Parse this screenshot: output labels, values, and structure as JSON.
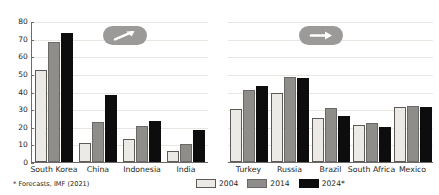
{
  "chart_data": {
    "type": "bar",
    "title": "",
    "subtitle": "",
    "xlabel": "",
    "ylabel": "",
    "ylim": [
      0,
      80
    ],
    "yticks": [
      0,
      10,
      20,
      30,
      40,
      50,
      60,
      70,
      80
    ],
    "grid": true,
    "legend_position": "bottom-right",
    "series": [
      {
        "name": "2004",
        "color": "#ebeae7"
      },
      {
        "name": "2014",
        "color": "#8e8d8a"
      },
      {
        "name": "2024*",
        "color": "#0d0d0d"
      }
    ],
    "panels": [
      {
        "id": "left",
        "badge": "arrow-up-right",
        "categories": [
          "South Korea",
          "China",
          "Indonesia",
          "India"
        ],
        "series": [
          {
            "name": "2004",
            "values": [
              52,
              11,
              13,
              6
            ]
          },
          {
            "name": "2014",
            "values": [
              68,
              22.5,
              20.5,
              10.5
            ]
          },
          {
            "name": "2024*",
            "values": [
              73,
              38,
              23.5,
              18
            ]
          }
        ]
      },
      {
        "id": "right",
        "badge": "arrow-right",
        "categories": [
          "Turkey",
          "Russia",
          "Brazil",
          "South Africa",
          "Mexico"
        ],
        "series": [
          {
            "name": "2004",
            "values": [
              30,
              39,
              25,
              21,
              31
            ]
          },
          {
            "name": "2014",
            "values": [
              41,
              48.5,
              30.5,
              22,
              32
            ]
          },
          {
            "name": "2024*",
            "values": [
              43,
              47.5,
              26,
              20,
              31
            ]
          }
        ]
      }
    ],
    "footnote": "* Forecasts, IMF (2021)"
  },
  "legend": {
    "items": [
      {
        "label": "2004"
      },
      {
        "label": "2014"
      },
      {
        "label": "2024*"
      }
    ]
  },
  "footnote": {
    "text": "* Forecasts, IMF (2021)"
  },
  "badges": {
    "left": {
      "name": "arrow-up-right-icon",
      "color": "#9b9a98"
    },
    "right": {
      "name": "arrow-right-icon",
      "color": "#9b9a98"
    }
  }
}
